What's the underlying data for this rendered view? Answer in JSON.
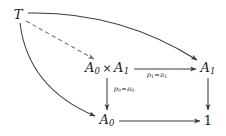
{
  "diagram": {
    "background": "#ffffff",
    "stroke_color": "#3a3a3a",
    "text_color": "#1b1b1b",
    "nodes": [
      {
        "id": "T",
        "label": "T",
        "x": 18,
        "y": 14
      },
      {
        "id": "product",
        "base": "A",
        "sub0": "0",
        "times": "×",
        "base2": "A",
        "sub1": "1",
        "x": 107,
        "y": 68
      },
      {
        "id": "A1",
        "base": "A",
        "sub": "1",
        "x": 208,
        "y": 68
      },
      {
        "id": "A0",
        "base": "A",
        "sub": "0",
        "x": 107,
        "y": 120
      },
      {
        "id": "one",
        "label": "1",
        "x": 208,
        "y": 120
      }
    ],
    "edge_labels": {
      "p1": {
        "p": "p",
        "psub": "1",
        "eq": "=",
        "pi": "π",
        "pisub": "1",
        "x": 157,
        "y": 76
      },
      "p0": {
        "p": "p",
        "psub": "0",
        "eq": "=",
        "pi": "π",
        "pisub": "0",
        "x": 124,
        "y": 90
      }
    },
    "edges": [
      {
        "from": "T",
        "to": "product",
        "style": "dashed",
        "name": "mediating-morphism"
      },
      {
        "from": "T",
        "to": "A1",
        "style": "curved-solid",
        "name": "cone-leg-to-a1"
      },
      {
        "from": "T",
        "to": "A0",
        "style": "curved-solid",
        "name": "cone-leg-to-a0"
      },
      {
        "from": "product",
        "to": "A1",
        "style": "solid",
        "name": "projection-p1"
      },
      {
        "from": "product",
        "to": "A0",
        "style": "solid",
        "name": "projection-p0"
      },
      {
        "from": "A1",
        "to": "one",
        "style": "solid",
        "name": "a1-to-terminal"
      },
      {
        "from": "A0",
        "to": "one",
        "style": "solid",
        "name": "a0-to-terminal"
      }
    ]
  }
}
